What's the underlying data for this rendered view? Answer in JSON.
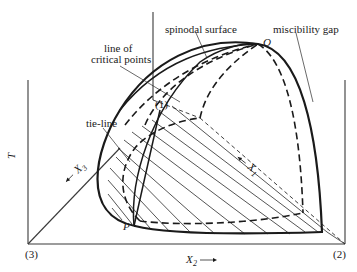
{
  "diagram": {
    "labels": {
      "spinodal_surface": "spinodal surface",
      "miscibility_gap": "miscibility gap",
      "line_of_critical_points_1": "line of",
      "line_of_critical_points_2": "critical points",
      "tie_line": "tie-line",
      "point_1": "(1)",
      "point_Q": "Q",
      "point_P": "P",
      "axis_T": "T",
      "axis_X3": "X",
      "axis_X3_sub": "3",
      "axis_X1": "X",
      "axis_X1_sub": "1",
      "axis_X2": "X",
      "axis_X2_sub": "2",
      "corner_3": "(3)",
      "corner_2": "(2)"
    },
    "colors": {
      "ink": "#1a1a1a",
      "background": "#ffffff"
    }
  }
}
